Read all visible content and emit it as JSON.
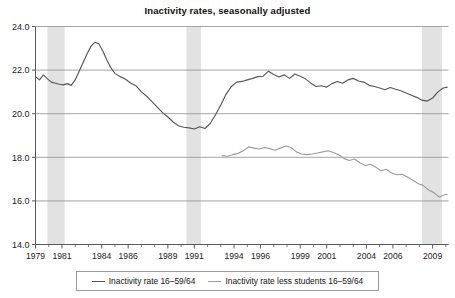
{
  "chart_data": {
    "type": "line",
    "title": "Inactivity rates, seasonally adjusted",
    "xlabel": "",
    "ylabel": "",
    "grid": true,
    "legend_position": "bottom",
    "xlim": [
      1979,
      2010.2
    ],
    "ylim": [
      14.0,
      24.0
    ],
    "ytick_labels": [
      "14.0",
      "16.0",
      "18.0",
      "20.0",
      "22.0",
      "24.0"
    ],
    "yticks": [
      14.0,
      16.0,
      18.0,
      20.0,
      22.0,
      24.0
    ],
    "xtick_labels": [
      "1979",
      "1981",
      "1984",
      "1986",
      "1989",
      "1991",
      "1994",
      "1996",
      "1999",
      "2001",
      "2004",
      "2006",
      "2009"
    ],
    "xticks": [
      1979,
      1981,
      1984,
      1986,
      1989,
      1991,
      1994,
      1996,
      1999,
      2001,
      2004,
      2006,
      2009
    ],
    "xminor_step": 1,
    "shaded_bands": [
      {
        "label": "recession-1980",
        "x0": 1979.9,
        "x1": 1981.2
      },
      {
        "label": "recession-1990",
        "x0": 1990.4,
        "x1": 1991.5
      },
      {
        "label": "recession-2008",
        "x0": 2008.2,
        "x1": 2009.7
      }
    ],
    "band_color": "#e2e2e2",
    "series": [
      {
        "name": "Inactivity rate 16–59/64",
        "color": "#575757",
        "x": [
          1979.0,
          1979.3,
          1979.6,
          1979.9,
          1980.2,
          1980.5,
          1980.8,
          1981.1,
          1981.4,
          1981.7,
          1982.0,
          1982.3,
          1982.6,
          1982.9,
          1983.2,
          1983.5,
          1983.8,
          1984.1,
          1984.4,
          1984.7,
          1985.0,
          1985.4,
          1985.8,
          1986.2,
          1986.6,
          1987.0,
          1987.4,
          1987.8,
          1988.2,
          1988.6,
          1989.0,
          1989.4,
          1989.8,
          1990.2,
          1990.6,
          1991.0,
          1991.4,
          1991.8,
          1992.2,
          1992.6,
          1993.0,
          1993.4,
          1993.8,
          1994.2,
          1994.6,
          1995.0,
          1995.4,
          1995.8,
          1996.2,
          1996.6,
          1997.0,
          1997.4,
          1997.8,
          1998.2,
          1998.6,
          1999.0,
          1999.4,
          1999.8,
          2000.2,
          2000.6,
          2001.0,
          2001.4,
          2001.8,
          2002.2,
          2002.6,
          2003.0,
          2003.4,
          2003.8,
          2004.2,
          2004.6,
          2005.0,
          2005.4,
          2005.8,
          2006.2,
          2006.6,
          2007.0,
          2007.4,
          2007.8,
          2008.2,
          2008.6,
          2009.0,
          2009.4,
          2009.8,
          2010.1
        ],
        "y": [
          21.7,
          21.55,
          21.78,
          21.6,
          21.45,
          21.4,
          21.35,
          21.32,
          21.38,
          21.3,
          21.55,
          21.95,
          22.35,
          22.75,
          23.1,
          23.28,
          23.2,
          22.85,
          22.45,
          22.1,
          21.85,
          21.7,
          21.58,
          21.4,
          21.28,
          21.0,
          20.8,
          20.55,
          20.3,
          20.05,
          19.85,
          19.62,
          19.45,
          19.38,
          19.35,
          19.3,
          19.4,
          19.32,
          19.55,
          19.95,
          20.4,
          20.9,
          21.25,
          21.45,
          21.48,
          21.55,
          21.62,
          21.7,
          21.72,
          21.95,
          21.8,
          21.68,
          21.78,
          21.62,
          21.82,
          21.72,
          21.6,
          21.4,
          21.25,
          21.28,
          21.22,
          21.38,
          21.48,
          21.4,
          21.55,
          21.62,
          21.5,
          21.45,
          21.3,
          21.25,
          21.18,
          21.1,
          21.2,
          21.12,
          21.05,
          20.95,
          20.85,
          20.75,
          20.62,
          20.58,
          20.72,
          21.0,
          21.18,
          21.22
        ]
      },
      {
        "name": "Inactivity rate less students 16–59/64",
        "color": "#9c9c9c",
        "x": [
          1993.1,
          1993.5,
          1993.9,
          1994.3,
          1994.7,
          1995.1,
          1995.5,
          1995.9,
          1996.3,
          1996.7,
          1997.1,
          1997.5,
          1997.9,
          1998.3,
          1998.7,
          1999.1,
          1999.5,
          1999.9,
          2000.3,
          2000.7,
          2001.1,
          2001.5,
          2001.9,
          2002.3,
          2002.7,
          2003.1,
          2003.5,
          2003.9,
          2004.3,
          2004.7,
          2005.1,
          2005.5,
          2005.9,
          2006.3,
          2006.7,
          2007.1,
          2007.5,
          2007.9,
          2008.3,
          2008.7,
          2009.1,
          2009.5,
          2009.9,
          2010.1
        ],
        "y": [
          18.08,
          18.05,
          18.12,
          18.18,
          18.3,
          18.48,
          18.42,
          18.38,
          18.45,
          18.4,
          18.32,
          18.42,
          18.52,
          18.45,
          18.25,
          18.15,
          18.12,
          18.15,
          18.2,
          18.25,
          18.3,
          18.22,
          18.12,
          17.95,
          17.85,
          17.92,
          17.75,
          17.62,
          17.68,
          17.55,
          17.38,
          17.45,
          17.28,
          17.2,
          17.22,
          17.1,
          16.95,
          16.8,
          16.7,
          16.5,
          16.38,
          16.18,
          16.28,
          16.3
        ]
      }
    ]
  },
  "legend": {
    "items": [
      {
        "label": "Inactivity rate 16–59/64",
        "color": "#575757"
      },
      {
        "label": "Inactivity rate less students 16–59/64",
        "color": "#9c9c9c"
      }
    ]
  },
  "style": {
    "axis_color": "#5a5a5a",
    "grid_color": "#8f8f8f",
    "background": "#ffffff"
  }
}
